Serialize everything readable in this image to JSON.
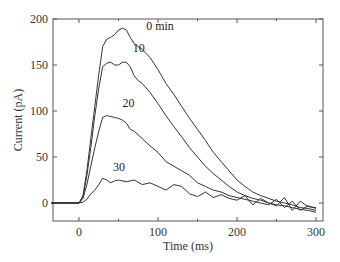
{
  "chart_data": {
    "type": "line",
    "title": "",
    "xlabel": "Time (ms)",
    "ylabel": "Current (pA)",
    "xlim": [
      -35,
      310
    ],
    "ylim": [
      -20,
      200
    ],
    "xticks": [
      0,
      100,
      200,
      300
    ],
    "yticks": [
      0,
      50,
      100,
      150,
      200
    ],
    "grid": false,
    "legend": "inline labels",
    "series": [
      {
        "name": "0 min",
        "label": "0 min",
        "x": [
          -35,
          0,
          5,
          10,
          15,
          20,
          25,
          30,
          35,
          40,
          45,
          50,
          55,
          60,
          65,
          70,
          75,
          80,
          90,
          100,
          110,
          120,
          130,
          140,
          150,
          160,
          170,
          180,
          190,
          200,
          210,
          220,
          230,
          240,
          250,
          260,
          270,
          280,
          290,
          300
        ],
        "values": [
          0,
          0,
          8,
          35,
          70,
          105,
          140,
          170,
          178,
          180,
          183,
          188,
          190,
          188,
          180,
          173,
          170,
          167,
          158,
          145,
          130,
          118,
          105,
          92,
          80,
          68,
          55,
          45,
          35,
          25,
          18,
          12,
          8,
          5,
          2,
          0,
          -2,
          -5,
          -6,
          -8
        ]
      },
      {
        "name": "10 min",
        "label": "10",
        "x": [
          -35,
          0,
          5,
          10,
          15,
          20,
          25,
          30,
          35,
          40,
          45,
          50,
          55,
          60,
          65,
          70,
          75,
          80,
          90,
          100,
          110,
          120,
          130,
          140,
          150,
          160,
          170,
          180,
          190,
          200,
          210,
          220,
          230,
          240,
          250,
          260,
          270,
          280,
          290,
          300
        ],
        "values": [
          0,
          0,
          7,
          30,
          60,
          95,
          125,
          148,
          152,
          153,
          150,
          150,
          153,
          153,
          148,
          138,
          133,
          130,
          120,
          108,
          95,
          83,
          72,
          60,
          50,
          40,
          32,
          25,
          18,
          12,
          8,
          5,
          3,
          0,
          -2,
          -3,
          -5,
          -7,
          -8,
          -10
        ]
      },
      {
        "name": "20 min",
        "label": "20",
        "x": [
          -35,
          0,
          5,
          10,
          15,
          20,
          25,
          30,
          35,
          40,
          45,
          50,
          55,
          60,
          65,
          70,
          80,
          90,
          100,
          110,
          120,
          130,
          140,
          150,
          160,
          170,
          180,
          190,
          200,
          210,
          220,
          230,
          240,
          250,
          260,
          270,
          280,
          290,
          300
        ],
        "values": [
          0,
          0,
          5,
          20,
          40,
          60,
          78,
          93,
          95,
          94,
          93,
          92,
          90,
          87,
          80,
          78,
          70,
          62,
          55,
          45,
          40,
          35,
          30,
          22,
          18,
          14,
          12,
          8,
          6,
          4,
          2,
          0,
          -2,
          4,
          -5,
          2,
          -8,
          -3,
          -6
        ]
      },
      {
        "name": "30 min",
        "label": "30",
        "x": [
          -35,
          0,
          5,
          10,
          15,
          20,
          25,
          30,
          35,
          40,
          45,
          50,
          60,
          70,
          80,
          90,
          100,
          110,
          120,
          130,
          140,
          150,
          160,
          170,
          180,
          190,
          200,
          210,
          220,
          230,
          240,
          250,
          260,
          270,
          280,
          290,
          300
        ],
        "values": [
          0,
          0,
          1,
          4,
          10,
          14,
          20,
          27,
          25,
          22,
          24,
          25,
          23,
          25,
          20,
          22,
          18,
          14,
          20,
          18,
          10,
          7,
          12,
          6,
          9,
          5,
          3,
          8,
          -2,
          5,
          0,
          -3,
          6,
          -8,
          2,
          -4,
          -5
        ]
      }
    ],
    "annotations": [
      {
        "text": "0 min",
        "x": 85,
        "y": 188
      },
      {
        "text": "10",
        "x": 68,
        "y": 164
      },
      {
        "text": "20",
        "x": 55,
        "y": 104
      },
      {
        "text": "30",
        "x": 43,
        "y": 35
      }
    ]
  }
}
